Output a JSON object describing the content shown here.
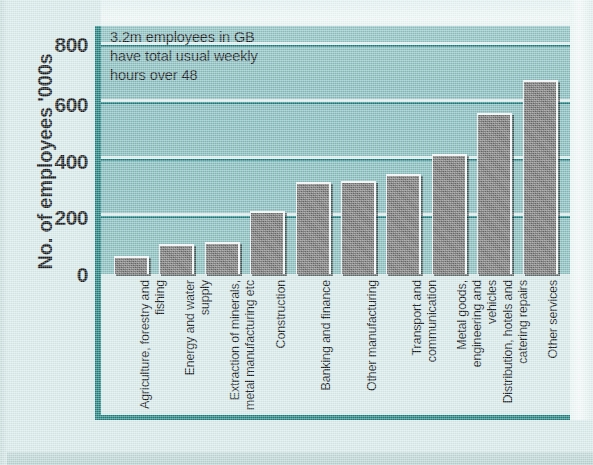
{
  "chart_data": {
    "type": "bar",
    "title": "",
    "annotation": "3.2m employees in GB\nhave total usual weekly\nhours over 48",
    "xlabel": "",
    "ylabel": "No. of employees '000s",
    "ylim": [
      0,
      880
    ],
    "yticks": [
      0,
      200,
      400,
      600,
      800
    ],
    "ytick_labels": [
      "0",
      "200",
      "400",
      "600",
      "800"
    ],
    "grid": true,
    "legend": "none",
    "categories": [
      "Agriculture, forestry and fishing",
      "Energy and water supply",
      "Extraction of minerals, metal manufacturing etc",
      "Construction",
      "Banking and finance",
      "Other manufacturing",
      "Transport and communication",
      "Metal goods, engineering and vehicles",
      "Distribution, hotels and catering repairs",
      "Other services"
    ],
    "values": [
      65,
      105,
      115,
      225,
      325,
      330,
      355,
      425,
      570,
      690
    ],
    "colors": {
      "bar_fill": "#6e6e6e",
      "plot_background": "#82b9ba",
      "gridline": "#1b7a7c",
      "axis": "#1d7d7d",
      "page_background": "#d7e9e9",
      "text": "#12171a"
    }
  }
}
